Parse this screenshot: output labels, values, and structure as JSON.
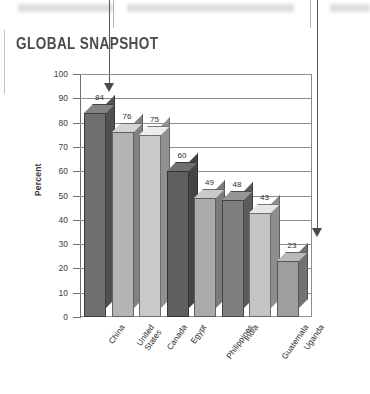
{
  "page": {
    "title": "GLOBAL SNAPSHOT"
  },
  "decorations": {
    "arrow_left_name": "down-arrow-left",
    "arrow_right_name": "down-arrow-right"
  },
  "chart_data": {
    "type": "bar",
    "title": "GLOBAL SNAPSHOT",
    "xlabel": "",
    "ylabel": "Percent",
    "ylim": [
      0,
      100
    ],
    "ytick_step": 10,
    "yticks": [
      0,
      10,
      20,
      30,
      40,
      50,
      60,
      70,
      80,
      90,
      100
    ],
    "grid": true,
    "legend": false,
    "categories": [
      "China",
      "United States",
      "Canada",
      "Egypt",
      "Philippines",
      "India",
      "Guatemala",
      "Uganda"
    ],
    "values": [
      84,
      76,
      75,
      60,
      49,
      48,
      43,
      23
    ],
    "value_labels": [
      "84",
      "76",
      "75",
      "60",
      "49",
      "48",
      "43",
      "23"
    ],
    "bar_colors": [
      "#6f6f6f",
      "#b4b4b4",
      "#c9c9c9",
      "#5f5f5f",
      "#ababab",
      "#7e7e7e",
      "#c4c4c4",
      "#9e9e9e"
    ],
    "style": "3d-bars"
  },
  "colors": {
    "axis": "#8d8d8d",
    "text": "#2f2f2f",
    "title": "#4c4c4c",
    "arrow": "#4a4a4a"
  }
}
